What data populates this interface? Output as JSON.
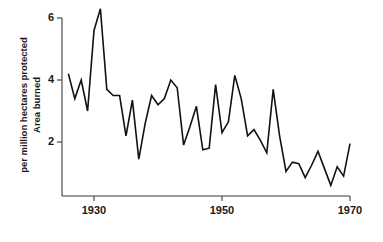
{
  "figure": {
    "background_color": "#ffffff",
    "line_color": "#111111",
    "axis_color": "#3b3b3b",
    "text_color": "#1a1a1a"
  },
  "axis_titles": {
    "ylabel_line1": "Area burned",
    "ylabel_line2": "per million hectares protected",
    "xlabel": ""
  },
  "ticks": {
    "y": [
      "6",
      "4",
      "2"
    ],
    "x": [
      "1930",
      "1950",
      "1970"
    ]
  },
  "chart_data": {
    "type": "line",
    "title": "",
    "xlabel": "",
    "ylabel": "Area burned per million hectares protected",
    "xlim": [
      1926,
      1970
    ],
    "ylim": [
      0,
      6.6
    ],
    "xticks": [
      1930,
      1950,
      1970
    ],
    "yticks": [
      2,
      4,
      6
    ],
    "grid": false,
    "legend": false,
    "series": [
      {
        "name": "Area burned per million hectares protected",
        "color": "#111111",
        "x": [
          1926,
          1927,
          1928,
          1929,
          1930,
          1931,
          1932,
          1933,
          1934,
          1935,
          1936,
          1937,
          1938,
          1939,
          1940,
          1941,
          1942,
          1943,
          1944,
          1945,
          1946,
          1947,
          1948,
          1949,
          1950,
          1951,
          1952,
          1953,
          1954,
          1955,
          1956,
          1957,
          1958,
          1959,
          1960,
          1961,
          1962,
          1963,
          1964,
          1965,
          1966,
          1967,
          1968,
          1969,
          1970
        ],
        "y": [
          4.2,
          3.4,
          4.0,
          3.0,
          5.6,
          6.3,
          3.7,
          3.5,
          3.5,
          2.2,
          3.35,
          1.45,
          2.6,
          3.5,
          3.2,
          3.4,
          4.0,
          3.75,
          1.9,
          2.5,
          3.15,
          1.75,
          1.8,
          3.85,
          2.3,
          2.65,
          4.15,
          3.4,
          2.2,
          2.4,
          2.05,
          1.65,
          3.7,
          2.2,
          1.05,
          1.35,
          1.3,
          0.85,
          1.25,
          1.7,
          1.15,
          0.6,
          1.2,
          0.9,
          1.95
        ]
      }
    ]
  }
}
